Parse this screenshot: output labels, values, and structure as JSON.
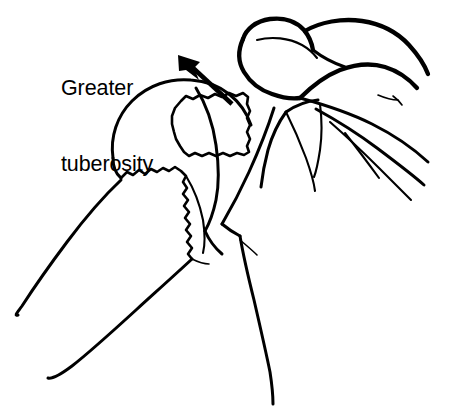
{
  "figure": {
    "background_color": "#ffffff",
    "ink_color": "#000000",
    "width": 467,
    "height": 415
  },
  "annotations": {
    "label": {
      "line1": "Greater",
      "line2": "tuberosity",
      "x": 61,
      "y": 25,
      "font_size": 21.5
    },
    "arrow": {
      "name": "displacement-arrow",
      "direction": "up-left",
      "tail_x": 232,
      "tail_y": 104,
      "tip_x": 181,
      "tip_y": 57
    }
  },
  "structures": [
    {
      "name": "humeral-head",
      "label": "Humeral head"
    },
    {
      "name": "greater-tuberosity-fragment",
      "label": "Greater tuberosity fragment"
    },
    {
      "name": "humeral-shaft",
      "label": "Humeral shaft"
    },
    {
      "name": "fracture-surface",
      "label": "Jagged fracture surface"
    },
    {
      "name": "acromion",
      "label": "Acromion"
    },
    {
      "name": "clavicle",
      "label": "Clavicle"
    },
    {
      "name": "coracoid",
      "label": "Coracoid process"
    },
    {
      "name": "scapular-spine",
      "label": "Scapular spine"
    },
    {
      "name": "lateral-border",
      "label": "Lateral border of scapula"
    }
  ]
}
